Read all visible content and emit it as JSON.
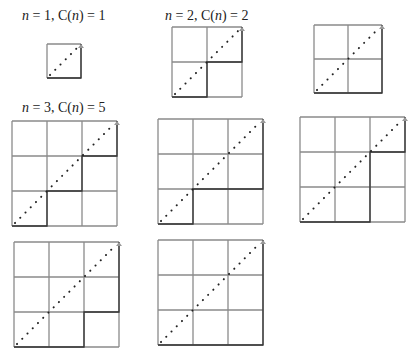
{
  "figure": {
    "labels": [
      {
        "n": "1",
        "c": "1",
        "x": 22,
        "y": 9
      },
      {
        "n": "2",
        "c": "2",
        "x": 165,
        "y": 9
      },
      {
        "n": "3",
        "c": "5",
        "x": 22,
        "y": 101
      }
    ],
    "grids": [
      {
        "id": "n1-path1",
        "n": 1,
        "x": 47,
        "y": 44,
        "size": 34,
        "path": "RU"
      },
      {
        "id": "n2-path1",
        "n": 2,
        "x": 172,
        "y": 27,
        "size": 70,
        "path": "RURU"
      },
      {
        "id": "n2-path2",
        "n": 2,
        "x": 314,
        "y": 25,
        "size": 68,
        "path": "RRUU"
      },
      {
        "id": "n3-path1",
        "n": 3,
        "x": 12,
        "y": 121,
        "size": 105,
        "path": "RURURU"
      },
      {
        "id": "n3-path2",
        "n": 3,
        "x": 158,
        "y": 119,
        "size": 105,
        "path": "RURRUU"
      },
      {
        "id": "n3-path3",
        "n": 3,
        "x": 300,
        "y": 117,
        "size": 105,
        "path": "RRUURU"
      },
      {
        "id": "n3-path4",
        "n": 3,
        "x": 14,
        "y": 242,
        "size": 105,
        "path": "RRURUU"
      },
      {
        "id": "n3-path5",
        "n": 3,
        "x": 158,
        "y": 240,
        "size": 105,
        "path": "RRRUUU"
      }
    ],
    "colors": {
      "grid_line": "#8a8a8a",
      "path_line": "#333333",
      "diagonal_dots": "#222222",
      "arrow": "#999999",
      "text": "#222222"
    }
  }
}
